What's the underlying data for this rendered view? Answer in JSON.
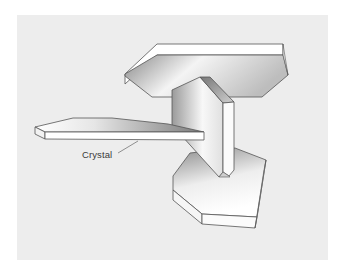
{
  "figure": {
    "labels": [
      {
        "text": "Crystal",
        "target": "thin-plate-crystal"
      }
    ],
    "colors": {
      "background": "#ededed",
      "edge": "#5a5a5a",
      "face_light": "#ffffff",
      "face_dark": "#8f8f8f"
    }
  }
}
